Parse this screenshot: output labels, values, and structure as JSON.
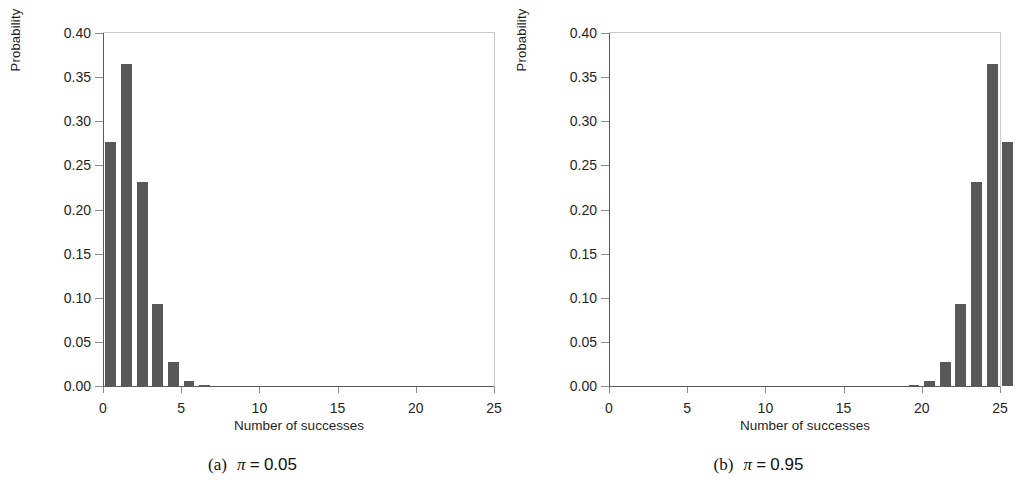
{
  "figure": {
    "bar_color": "#585858",
    "axis_color": "#5a5a5a",
    "frame_color": "#c9c9c9"
  },
  "chart_data": [
    {
      "type": "bar",
      "panel": "a",
      "title": "",
      "caption_index": "(a)",
      "caption_symbol": "π",
      "caption_eq": "=",
      "caption_value": "0.05",
      "xlabel": "Number of successes",
      "ylabel": "Probability",
      "xlim": [
        0,
        25
      ],
      "ylim": [
        0.0,
        0.4
      ],
      "xticks": [
        0,
        5,
        10,
        15,
        20,
        25
      ],
      "xticklabels": [
        "0",
        "5",
        "10",
        "15",
        "20",
        "25"
      ],
      "yticks": [
        0.0,
        0.05,
        0.1,
        0.15,
        0.2,
        0.25,
        0.3,
        0.35,
        0.4
      ],
      "yticklabels": [
        "0.00",
        "0.05",
        "0.10",
        "0.15",
        "0.20",
        "0.25",
        "0.30",
        "0.35",
        "0.40"
      ],
      "grid": false,
      "legend": null,
      "categories": [
        0,
        1,
        2,
        3,
        4,
        5,
        6,
        7,
        8,
        9,
        10,
        11,
        12,
        13,
        14,
        15,
        16,
        17,
        18,
        19,
        20,
        21,
        22,
        23,
        24,
        25
      ],
      "values": [
        0.277,
        0.365,
        0.231,
        0.093,
        0.027,
        0.006,
        0.001,
        0.0,
        0.0,
        0.0,
        0.0,
        0.0,
        0.0,
        0.0,
        0.0,
        0.0,
        0.0,
        0.0,
        0.0,
        0.0,
        0.0,
        0.0,
        0.0,
        0.0,
        0.0,
        0.0
      ]
    },
    {
      "type": "bar",
      "panel": "b",
      "title": "",
      "caption_index": "(b)",
      "caption_symbol": "π",
      "caption_eq": "=",
      "caption_value": "0.95",
      "xlabel": "Number of successes",
      "ylabel": "Probability",
      "xlim": [
        0,
        25
      ],
      "ylim": [
        0.0,
        0.4
      ],
      "xticks": [
        0,
        5,
        10,
        15,
        20,
        25
      ],
      "xticklabels": [
        "0",
        "5",
        "10",
        "15",
        "20",
        "25"
      ],
      "yticks": [
        0.0,
        0.05,
        0.1,
        0.15,
        0.2,
        0.25,
        0.3,
        0.35,
        0.4
      ],
      "yticklabels": [
        "0.00",
        "0.05",
        "0.10",
        "0.15",
        "0.20",
        "0.25",
        "0.30",
        "0.35",
        "0.40"
      ],
      "grid": false,
      "legend": null,
      "categories": [
        0,
        1,
        2,
        3,
        4,
        5,
        6,
        7,
        8,
        9,
        10,
        11,
        12,
        13,
        14,
        15,
        16,
        17,
        18,
        19,
        20,
        21,
        22,
        23,
        24,
        25
      ],
      "values": [
        0.0,
        0.0,
        0.0,
        0.0,
        0.0,
        0.0,
        0.0,
        0.0,
        0.0,
        0.0,
        0.0,
        0.0,
        0.0,
        0.0,
        0.0,
        0.0,
        0.0,
        0.0,
        0.0,
        0.001,
        0.006,
        0.027,
        0.093,
        0.231,
        0.365,
        0.277
      ]
    }
  ]
}
